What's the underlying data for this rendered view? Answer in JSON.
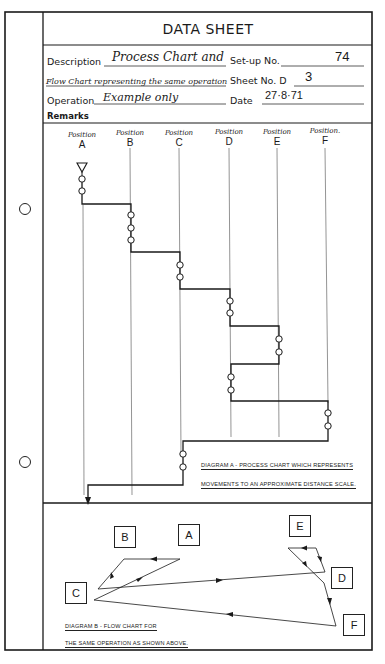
{
  "header": {
    "title": "DATA SHEET"
  },
  "fields": {
    "description_label": "Description",
    "description_line1": "Process Chart and",
    "description_line2": "Flow Chart representing the same operation",
    "operation_label": "Operation",
    "operation_value": "Example only",
    "remarks_label": "Remarks",
    "setup_label": "Set-up No.",
    "setup_value": "74",
    "sheet_label": "Sheet No. D",
    "sheet_value": "3",
    "date_label": "Date",
    "date_value": "27·8·71"
  },
  "diagram_a": {
    "positions": [
      {
        "word": "Position",
        "letter": "A"
      },
      {
        "word": "Position",
        "letter": "B"
      },
      {
        "word": "Position",
        "letter": "C"
      },
      {
        "word": "Position",
        "letter": "D"
      },
      {
        "word": "Position",
        "letter": "E"
      },
      {
        "word": "Position.",
        "letter": "F"
      }
    ],
    "caption_line1": "Diagram A - Process chart which represents",
    "caption_line2": "movements to an approximate distance scale."
  },
  "diagram_b": {
    "nodes": [
      "A",
      "B",
      "C",
      "D",
      "E",
      "F"
    ],
    "caption_line1": "Diagram B - Flow chart for",
    "caption_line2": "the same operation as shown above."
  }
}
